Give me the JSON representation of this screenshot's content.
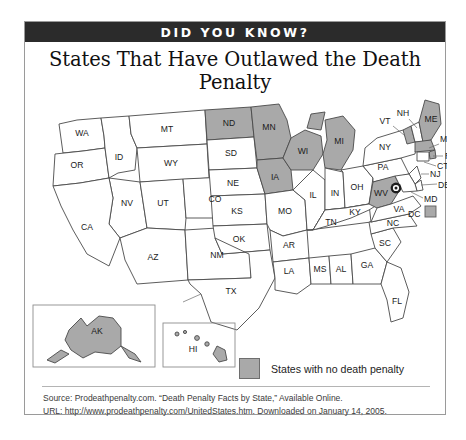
{
  "banner": {
    "label": "DID YOU KNOW?"
  },
  "title": "States That Have Outlawed the Death Penalty",
  "legend": {
    "swatch_color": "#a9a9a9",
    "label": "States with no death penalty"
  },
  "source": {
    "line1": "Source:  Prodeathpenalty.com. “Death Penalty Facts by State,” Available Online.",
    "line2": "URL: http://www.prodeathpenalty.com/UnitedStates.htm. Downloaded on January 14, 2005."
  },
  "map": {
    "highlight_color": "#a9a9a9",
    "default_color": "#ffffff",
    "dc_marker": "dc-target-marker",
    "insets": [
      "alaska-inset",
      "hawaii-inset"
    ],
    "states": [
      {
        "code": "WA",
        "no_death_penalty": false
      },
      {
        "code": "OR",
        "no_death_penalty": false
      },
      {
        "code": "ID",
        "no_death_penalty": false
      },
      {
        "code": "MT",
        "no_death_penalty": false
      },
      {
        "code": "ND",
        "no_death_penalty": true
      },
      {
        "code": "MN",
        "no_death_penalty": true
      },
      {
        "code": "SD",
        "no_death_penalty": false
      },
      {
        "code": "WI",
        "no_death_penalty": true
      },
      {
        "code": "MI",
        "no_death_penalty": true
      },
      {
        "code": "IA",
        "no_death_penalty": true
      },
      {
        "code": "NV",
        "no_death_penalty": false
      },
      {
        "code": "UT",
        "no_death_penalty": false
      },
      {
        "code": "WY",
        "no_death_penalty": false
      },
      {
        "code": "NE",
        "no_death_penalty": false
      },
      {
        "code": "IL",
        "no_death_penalty": false
      },
      {
        "code": "IN",
        "no_death_penalty": false
      },
      {
        "code": "OH",
        "no_death_penalty": false
      },
      {
        "code": "PA",
        "no_death_penalty": false
      },
      {
        "code": "CA",
        "no_death_penalty": false
      },
      {
        "code": "CO",
        "no_death_penalty": false
      },
      {
        "code": "KS",
        "no_death_penalty": false
      },
      {
        "code": "MO",
        "no_death_penalty": false
      },
      {
        "code": "KY",
        "no_death_penalty": false
      },
      {
        "code": "WV",
        "no_death_penalty": true
      },
      {
        "code": "VA",
        "no_death_penalty": false
      },
      {
        "code": "AZ",
        "no_death_penalty": false
      },
      {
        "code": "NM",
        "no_death_penalty": false
      },
      {
        "code": "OK",
        "no_death_penalty": false
      },
      {
        "code": "AR",
        "no_death_penalty": false
      },
      {
        "code": "TN",
        "no_death_penalty": false
      },
      {
        "code": "NC",
        "no_death_penalty": false
      },
      {
        "code": "SC",
        "no_death_penalty": false
      },
      {
        "code": "TX",
        "no_death_penalty": false
      },
      {
        "code": "LA",
        "no_death_penalty": false
      },
      {
        "code": "MS",
        "no_death_penalty": false
      },
      {
        "code": "AL",
        "no_death_penalty": false
      },
      {
        "code": "GA",
        "no_death_penalty": false
      },
      {
        "code": "FL",
        "no_death_penalty": false
      },
      {
        "code": "NH",
        "no_death_penalty": false
      },
      {
        "code": "VT",
        "no_death_penalty": true
      },
      {
        "code": "ME",
        "no_death_penalty": true
      },
      {
        "code": "MA",
        "no_death_penalty": true
      },
      {
        "code": "RI",
        "no_death_penalty": true
      },
      {
        "code": "CT",
        "no_death_penalty": false
      },
      {
        "code": "NY",
        "no_death_penalty": false
      },
      {
        "code": "NJ",
        "no_death_penalty": false
      },
      {
        "code": "DE",
        "no_death_penalty": false
      },
      {
        "code": "MD",
        "no_death_penalty": false
      },
      {
        "code": "DC",
        "no_death_penalty": true
      },
      {
        "code": "AK",
        "no_death_penalty": true
      },
      {
        "code": "HI",
        "no_death_penalty": true
      }
    ],
    "labels": {
      "WA": "WA",
      "OR": "OR",
      "ID": "ID",
      "MT": "MT",
      "ND": "ND",
      "MN": "MN",
      "SD": "SD",
      "WI": "WI",
      "MI": "MI",
      "IA": "IA",
      "NV": "NV",
      "UT": "UT",
      "WY": "WY",
      "NE": "NE",
      "IL": "IL",
      "IN": "IN",
      "OH": "OH",
      "PA": "PA",
      "CA": "CA",
      "CO": "CO",
      "KS": "KS",
      "MO": "MO",
      "KY": "KY",
      "WV": "WV",
      "VA": "VA",
      "AZ": "AZ",
      "NM": "NM",
      "OK": "OK",
      "AR": "AR",
      "TN": "TN",
      "NC": "NC",
      "SC": "SC",
      "TX": "TX",
      "LA": "LA",
      "MS": "MS",
      "AL": "AL",
      "GA": "GA",
      "FL": "FL",
      "NH": "NH",
      "VT": "VT",
      "ME": "ME",
      "MA": "MA",
      "RI": "RI",
      "CT": "CT",
      "NY": "NY",
      "NJ": "NJ",
      "DE": "DE",
      "MD": "MD",
      "DC": "DC",
      "AK": "AK",
      "HI": "HI"
    }
  }
}
